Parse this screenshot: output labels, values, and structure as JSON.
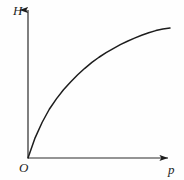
{
  "figure": {
    "kind": "line-graph",
    "background_color": "#fefefe",
    "stroke_color": "#1d1d1d",
    "width": 184,
    "height": 180,
    "y_axis_label": "H",
    "x_axis_label": "p",
    "origin_label": "O",
    "axes": {
      "origin": [
        28,
        158
      ],
      "y_axis_top": [
        28,
        6
      ],
      "x_axis_right": [
        172,
        158
      ],
      "arrowheads": [
        "y-axis-top",
        "x-axis-right"
      ]
    }
  },
  "chart_data": {
    "type": "line",
    "title": "",
    "xlabel": "p",
    "ylabel": "H",
    "grid": false,
    "legend": null,
    "axis_ticks": {
      "x": [],
      "y": []
    },
    "xlim": [
      0,
      1
    ],
    "ylim": [
      0,
      1
    ],
    "series": [
      {
        "name": "H versus p",
        "description": "monotonically increasing, concave down, passing through the origin",
        "x": [
          0.0,
          0.05,
          0.1,
          0.15,
          0.2,
          0.25,
          0.3,
          0.35,
          0.4,
          0.45,
          0.5,
          0.55,
          0.6,
          0.65,
          0.7,
          0.75,
          0.8,
          0.85,
          0.9,
          0.95,
          1.0
        ],
        "y": [
          0.0,
          0.155,
          0.275,
          0.375,
          0.455,
          0.525,
          0.585,
          0.64,
          0.69,
          0.735,
          0.775,
          0.81,
          0.842,
          0.872,
          0.898,
          0.922,
          0.944,
          0.963,
          0.98,
          0.992,
          1.0
        ]
      }
    ],
    "pixel_path": {
      "start": [
        28,
        158
      ],
      "end": [
        170,
        28
      ],
      "control_points": [
        [
          60,
          110
        ],
        [
          92,
          68
        ],
        [
          130,
          45
        ]
      ]
    }
  }
}
